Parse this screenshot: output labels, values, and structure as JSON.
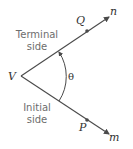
{
  "diagram": {
    "vertex": {
      "label": "V",
      "x": 21,
      "y": 76
    },
    "terminal_side": {
      "line1": "Terminal",
      "line2": "side",
      "ray_label": "n",
      "point_label": "Q",
      "end": {
        "x": 109,
        "y": 17
      },
      "point": {
        "x": 87,
        "y": 31
      }
    },
    "initial_side": {
      "line1": "Initial",
      "line2": "side",
      "ray_label": "m",
      "point_label": "P",
      "end": {
        "x": 109,
        "y": 134
      },
      "point": {
        "x": 87,
        "y": 120
      }
    },
    "angle_label": "θ",
    "colors": {
      "line": "#4a4a4a",
      "side_text": "#6d6d6d",
      "label_text": "#333333",
      "background": "#ffffff"
    }
  }
}
